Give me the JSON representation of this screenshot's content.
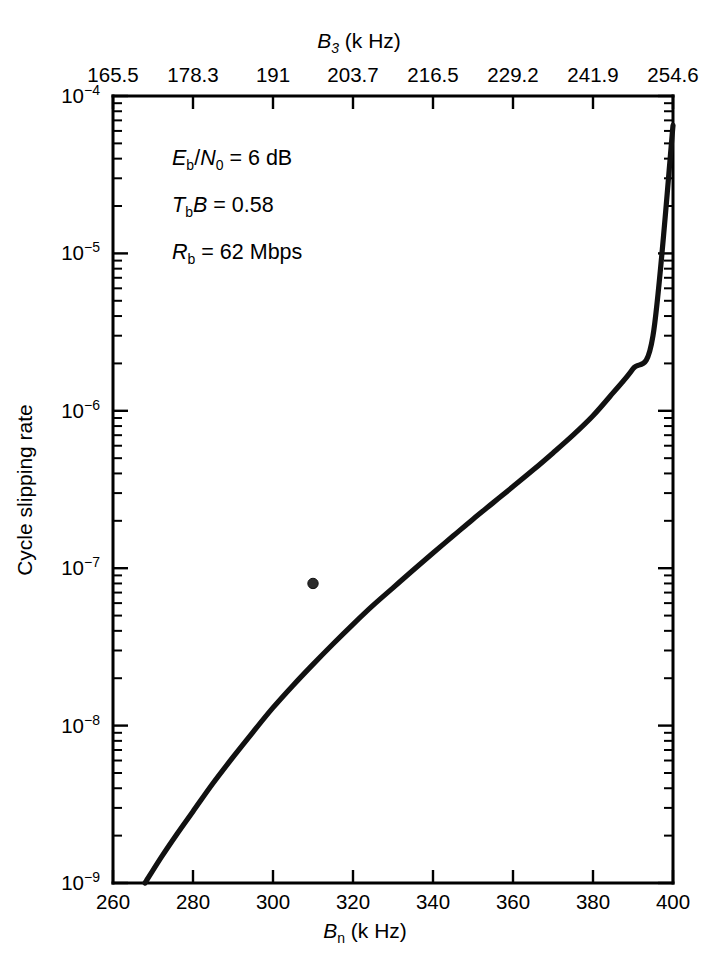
{
  "figure": {
    "background": "#ffffff",
    "line_color": "#111111",
    "caption_faint": ""
  },
  "axes": {
    "top": {
      "title_main": "B",
      "title_sub": "3",
      "title_unit": " (k Hz)",
      "title_full": "B3 (k Hz)",
      "tick_labels": [
        "165.5",
        "178.3",
        "191",
        "203.7",
        "216.5",
        "229.2",
        "241.9",
        "254.6"
      ],
      "tick_positions_bottom_equiv": [
        260,
        280,
        300,
        320,
        340,
        360,
        380,
        400
      ]
    },
    "bottom": {
      "title_main": "B",
      "title_sub": "n",
      "title_unit": " (k Hz)",
      "title_full": "Bn (k Hz)",
      "tick_labels": [
        "260",
        "280",
        "300",
        "320",
        "340",
        "360",
        "380",
        "400"
      ],
      "min": 260,
      "max": 400,
      "scale": "linear"
    },
    "left": {
      "title": "Cycle slipping rate",
      "tick_labels": [
        "10-4",
        "10-5",
        "10-6",
        "10-7",
        "10-8",
        "10-9"
      ],
      "tick_exponents": [
        "-4",
        "-5",
        "-6",
        "-7",
        "-8",
        "-9"
      ],
      "mantissa": "10",
      "min": 1e-09,
      "max": 0.0001,
      "scale": "log"
    }
  },
  "annotations": [
    {
      "id": "ebn0",
      "parts": [
        {
          "t": "E",
          "style": "italic"
        },
        {
          "t": "b",
          "style": "sub"
        },
        {
          "t": "/",
          "style": "roman"
        },
        {
          "t": "N",
          "style": "italic"
        },
        {
          "t": "0",
          "style": "sub"
        },
        {
          "t": " = 6 dB",
          "style": "roman"
        }
      ],
      "plain": "Eb/N0 = 6 dB"
    },
    {
      "id": "tbb",
      "parts": [
        {
          "t": "T",
          "style": "italic"
        },
        {
          "t": "b",
          "style": "sub"
        },
        {
          "t": "B",
          "style": "italic"
        },
        {
          "t": " = 0.58",
          "style": "roman"
        }
      ],
      "plain": "TbB = 0.58"
    },
    {
      "id": "rb",
      "parts": [
        {
          "t": "R",
          "style": "italic"
        },
        {
          "t": "b",
          "style": "sub"
        },
        {
          "t": " = 62 Mbps",
          "style": "roman"
        }
      ],
      "plain": "Rb = 62 Mbps"
    }
  ],
  "chart_data": {
    "type": "line",
    "title": "",
    "xlabel": "Bn (k Hz)",
    "ylabel": "Cycle slipping rate",
    "x2label": "B3 (k Hz)",
    "xlim": [
      260,
      400
    ],
    "ylim": [
      1e-09,
      0.0001
    ],
    "yscale": "log",
    "xscale": "linear",
    "grid": false,
    "legend": null,
    "series": [
      {
        "name": "Cycle slipping rate vs loop bandwidth",
        "x": [
          268,
          272,
          276,
          280,
          285,
          290,
          295,
          300,
          305,
          310,
          315,
          320,
          325,
          330,
          335,
          340,
          345,
          350,
          355,
          360,
          365,
          370,
          375,
          380,
          385,
          390,
          395,
          400
        ],
        "y": [
          1e-09,
          1.45e-09,
          2.05e-09,
          2.85e-09,
          4.3e-09,
          6.3e-09,
          9.1e-09,
          1.3e-08,
          1.8e-08,
          2.45e-08,
          3.3e-08,
          4.4e-08,
          5.8e-08,
          7.5e-08,
          9.7e-08,
          1.25e-07,
          1.6e-07,
          2.05e-07,
          2.6e-07,
          3.3e-07,
          4.2e-07,
          5.4e-07,
          7e-07,
          9.3e-07,
          1.3e-06,
          1.85e-06,
          3e-06,
          6.5e-05
        ]
      }
    ],
    "markers": [
      {
        "x": 310,
        "y": 8e-08,
        "label": "operating point",
        "shape": "circle"
      }
    ],
    "top_axis": {
      "tick_labels": [
        "165.5",
        "178.3",
        "191",
        "203.7",
        "216.5",
        "229.2",
        "241.9",
        "254.6"
      ],
      "min": 165.5,
      "max": 254.6
    }
  }
}
